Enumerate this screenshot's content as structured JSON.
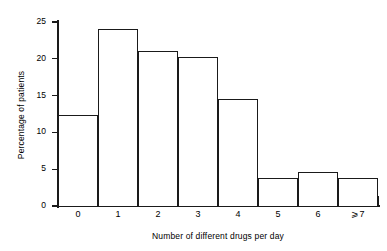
{
  "chart_data": {
    "type": "bar",
    "title": "",
    "subtitle": "",
    "xlabel": "Number of different drugs per day",
    "ylabel": "Percentage of patients",
    "categories": [
      "0",
      "1",
      "2",
      "3",
      "4",
      "5",
      "6",
      "⩾7"
    ],
    "values": [
      12.4,
      24.0,
      21.0,
      20.2,
      14.6,
      3.8,
      4.6,
      3.8
    ],
    "ylim": [
      0,
      25
    ],
    "yticks": [
      "0",
      "5",
      "10",
      "15",
      "20",
      "25"
    ],
    "ytick_values": [
      0,
      5,
      10,
      15,
      20,
      25
    ],
    "grid": false,
    "legend": "none",
    "style": {
      "bar_fill": "#ffffff",
      "bar_edge": "#1a1a1a",
      "axis_color": "#1a1a1a",
      "background": "#ffffff"
    }
  }
}
